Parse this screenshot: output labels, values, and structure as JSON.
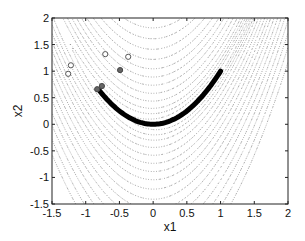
{
  "chart_data": {
    "type": "contour",
    "title": "",
    "xlabel": "x1",
    "ylabel": "x2",
    "xlim": [
      -1.5,
      2
    ],
    "ylim": [
      -1.5,
      2
    ],
    "xticks": [
      -1.5,
      -1,
      -0.5,
      0,
      0.5,
      1,
      1.5,
      2
    ],
    "xtick_labels": [
      "-1.5",
      "-1",
      "-0.5",
      "0",
      "0.5",
      "1",
      "1.5",
      "2"
    ],
    "yticks": [
      -1.5,
      -1,
      -0.5,
      0,
      0.5,
      1,
      1.5,
      2
    ],
    "ytick_labels": [
      "-1.5",
      "-1",
      "-0.5",
      "0",
      "0.5",
      "1",
      "1.5",
      "2"
    ],
    "grid": false,
    "legend": null,
    "contour_function": "100*(x2-x1^2)^2 + (1-x1)^2",
    "contour_levels": [
      0.5,
      2,
      5,
      10,
      20,
      35,
      55,
      80,
      110,
      150,
      200,
      260,
      330,
      420,
      520,
      650,
      800
    ],
    "contour_style": "dotted gray",
    "path": {
      "description": "optimization trajectory along valley x2 = x1^2",
      "start": [
        -0.8,
        0.64
      ],
      "end": [
        1,
        1
      ],
      "color": "#000000"
    },
    "open_points": [
      [
        -0.71,
        1.32
      ],
      [
        -0.37,
        1.27
      ],
      [
        -1.22,
        1.11
      ],
      [
        -1.26,
        0.95
      ]
    ],
    "filled_points": [
      [
        -0.49,
        1.02
      ],
      [
        -0.83,
        0.66
      ],
      [
        -0.76,
        0.72
      ]
    ]
  }
}
